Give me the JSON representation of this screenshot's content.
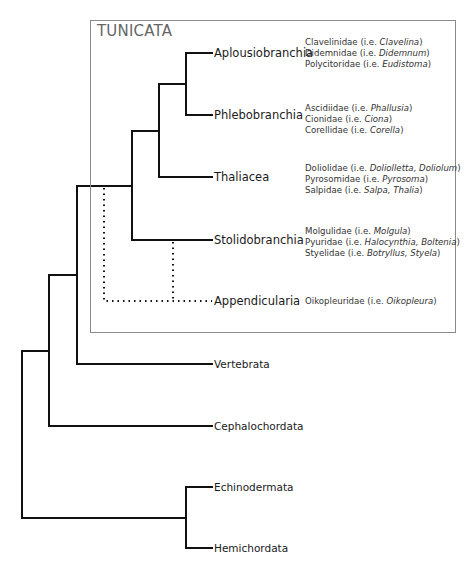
{
  "box": {
    "title": "TUNICATA"
  },
  "tunicata_clades": [
    {
      "name": "Aplousiobranchia",
      "y": 53,
      "families": [
        {
          "family": "Clavelinidae (i.e. ",
          "genera": "Clavelina",
          "close": ")"
        },
        {
          "family": "Didemnidae (i.e. ",
          "genera": "Didemnum",
          "close": ")"
        },
        {
          "family": "Polycitoridae (i.e. ",
          "genera": "Eudistoma",
          "close": ")"
        }
      ]
    },
    {
      "name": "Phlebobranchia",
      "y": 115,
      "families": [
        {
          "family": "Ascidiidae (i.e. ",
          "genera": "Phallusia",
          "close": ")"
        },
        {
          "family": "Cionidae (i.e. ",
          "genera": "Ciona",
          "close": ")"
        },
        {
          "family": "Corellidae (i.e. ",
          "genera": "Corella",
          "close": ")"
        }
      ]
    },
    {
      "name": "Thaliacea",
      "y": 177,
      "families": [
        {
          "family": "Doliolidae (i.e. ",
          "genera": "Doliolletta, Doliolum",
          "close": ")"
        },
        {
          "family": "Pyrosomidae (i.e. ",
          "genera": "Pyrosoma",
          "close": ")"
        },
        {
          "family": "Salpidae (i.e. ",
          "genera": "Salpa, Thalia",
          "close": ")"
        }
      ]
    },
    {
      "name": "Stolidobranchia",
      "y": 240,
      "families": [
        {
          "family": "Molgulidae (i.e. ",
          "genera": "Molgula",
          "close": ")"
        },
        {
          "family": "Pyuridae (i.e. ",
          "genera": "Halocynthia, Boltenia",
          "close": ")"
        },
        {
          "family": "Styelidae (i.e. ",
          "genera": "Botryllus, Styela",
          "close": ")"
        }
      ]
    },
    {
      "name": "Appendicularia",
      "y": 301,
      "families": [
        {
          "family": "Oikopleuridae (i.e. ",
          "genera": "Oikopleura",
          "close": ")"
        }
      ]
    }
  ],
  "outgroups": [
    {
      "name": "Vertebrata",
      "y": 364
    },
    {
      "name": "Cephalochordata",
      "y": 426
    },
    {
      "name": "Echinodermata",
      "y": 487
    },
    {
      "name": "Hemichordata",
      "y": 548
    }
  ],
  "colors": {
    "line": "#111111",
    "box_border": "#8a8a8a",
    "title": "#666666"
  }
}
